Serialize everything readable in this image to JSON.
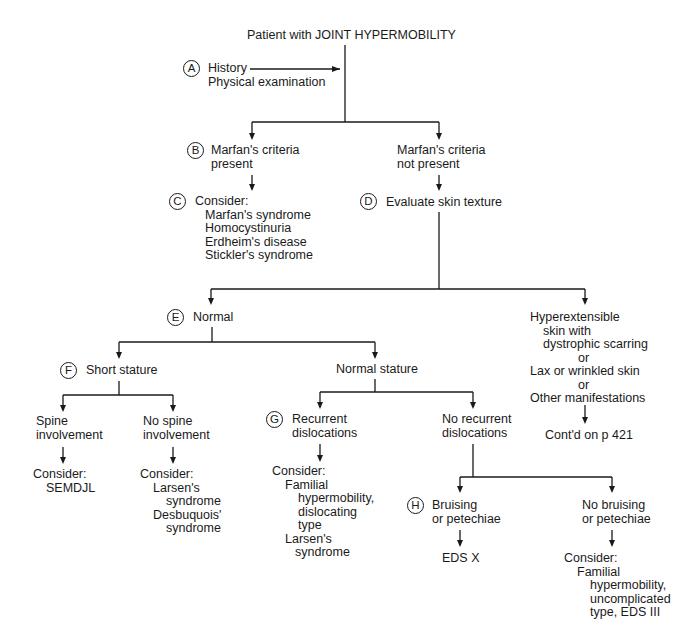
{
  "diagram": {
    "title": "Patient with JOINT HYPERMOBILITY",
    "nodes": {
      "A": {
        "badge": "A",
        "lines": [
          "History",
          "Physical examination"
        ]
      },
      "B": {
        "badge": "B",
        "lines": [
          "Marfan's criteria",
          "present"
        ]
      },
      "B_alt": {
        "lines": [
          "Marfan's criteria",
          "not present"
        ]
      },
      "C": {
        "badge": "C",
        "heading": "Consider:",
        "items": [
          "Marfan's syndrome",
          "Homocystinuria",
          "Erdheim's disease",
          "Stickler's syndrome"
        ]
      },
      "D": {
        "badge": "D",
        "label": "Evaluate skin texture"
      },
      "E": {
        "badge": "E",
        "label": "Normal"
      },
      "hyperext": {
        "lines": [
          "Hyperextensible",
          "skin with",
          "dystrophic scarring",
          "or",
          "Lax or wrinkled skin",
          "or",
          "Other manifestations"
        ]
      },
      "contd": {
        "label": "Cont'd on p 421"
      },
      "F": {
        "badge": "F",
        "label": "Short stature"
      },
      "normal_stature": {
        "label": "Normal stature"
      },
      "spine": {
        "lines": [
          "Spine",
          "involvement"
        ]
      },
      "spine_consider": {
        "heading": "Consider:",
        "items": [
          "SEMDJL"
        ]
      },
      "no_spine": {
        "lines": [
          "No spine",
          "involvement"
        ]
      },
      "no_spine_consider": {
        "heading": "Consider:",
        "items": [
          "Larsen's",
          "syndrome",
          "Desbuquois'",
          "syndrome"
        ]
      },
      "G": {
        "badge": "G",
        "lines": [
          "Recurrent",
          "dislocations"
        ]
      },
      "G_consider": {
        "heading": "Consider:",
        "items": [
          "Familial",
          "hypermobility,",
          "dislocating",
          "type",
          "Larsen's",
          "syndrome"
        ]
      },
      "no_recurrent": {
        "lines": [
          "No recurrent",
          "dislocations"
        ]
      },
      "H": {
        "badge": "H",
        "lines": [
          "Bruising",
          "or petechiae"
        ]
      },
      "H_result": {
        "label": "EDS X"
      },
      "no_bruising": {
        "lines": [
          "No bruising",
          "or petechiae"
        ]
      },
      "no_bruising_consider": {
        "heading": "Consider:",
        "items": [
          "Familial",
          "hypermobility,",
          "uncomplicated",
          "type, EDS III"
        ]
      }
    },
    "colors": {
      "ink": "#1a1a1a",
      "background": "#ffffff"
    }
  }
}
